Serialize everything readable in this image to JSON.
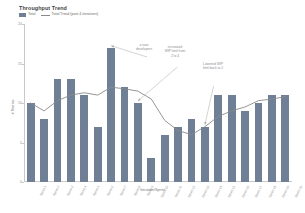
{
  "chart_data": {
    "type": "bar",
    "title": "Throughput Trend",
    "xlabel": "Iteration/Sprint",
    "ylabel": "# Stories",
    "ylim": [
      0,
      20
    ],
    "yticks": [
      0,
      5,
      10,
      15,
      20
    ],
    "grid": false,
    "legend_position": "top-left",
    "categories": [
      "Sprint 1",
      "Sprint 2",
      "Sprint 3",
      "Sprint 4",
      "Sprint 5",
      "Sprint 6",
      "Sprint 7",
      "Sprint 8",
      "Sprint 9",
      "Sprint 10",
      "Sprint 11",
      "Sprint 12",
      "Sprint 13",
      "Sprint 14",
      "Sprint 15",
      "Sprint 16",
      "Sprint 17",
      "Sprint 18",
      "Sprint 19",
      "Sprint 20"
    ],
    "series": [
      {
        "name": "Total",
        "type": "bar",
        "color": "#6e7f96",
        "values": [
          10,
          8,
          13,
          13,
          11,
          7,
          17,
          12,
          10,
          3,
          6,
          7,
          8,
          7,
          11,
          11,
          9,
          10,
          11,
          11
        ]
      },
      {
        "name": "Total Trend (past 4 iterations)",
        "type": "line",
        "color": "#8a8a8a",
        "values": [
          10.0,
          9.0,
          10.3,
          11.0,
          11.3,
          11.0,
          12.0,
          11.8,
          11.5,
          10.5,
          7.8,
          6.5,
          6.0,
          7.0,
          8.3,
          9.0,
          9.5,
          10.3,
          10.5,
          10.8
        ]
      }
    ],
    "annotations": [
      {
        "id": "scrum-development",
        "text": "a new\ndevelopers",
        "x_category": "Sprint 7"
      },
      {
        "id": "increased-wip-limit",
        "text": "increased\nWIP limit from\n2 to 4",
        "x_category": "Sprint 9"
      },
      {
        "id": "lowered-wip-limit",
        "text": "Lowered WIP\nlimit back to 2",
        "x_category": "Sprint 14"
      }
    ]
  },
  "legend": {
    "items": [
      {
        "label": "Total",
        "marker": "swatch"
      },
      {
        "label": "Total Trend (past 4 iterations)",
        "marker": "line"
      }
    ]
  }
}
